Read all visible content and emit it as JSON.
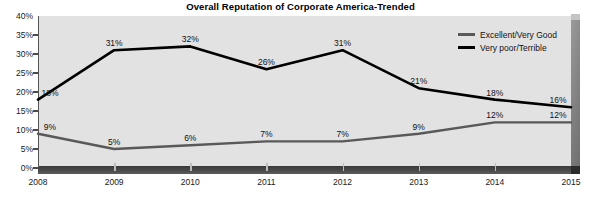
{
  "chart_data": {
    "type": "line",
    "title": "Overall Reputation of Corporate America-Trended",
    "xlabel": "",
    "ylabel": "",
    "categories": [
      "2008",
      "2009",
      "2010",
      "2011",
      "2012",
      "2013",
      "2014",
      "2015"
    ],
    "ylim": [
      0,
      40
    ],
    "yticks": [
      "0%",
      "5%",
      "10%",
      "15%",
      "20%",
      "25%",
      "30%",
      "35%",
      "40%"
    ],
    "ytick_values": [
      0,
      5,
      10,
      15,
      20,
      25,
      30,
      35,
      40
    ],
    "grid": false,
    "legend_position": "top-right",
    "series": [
      {
        "name": "Excellent/Very Good",
        "color": "#595959",
        "values": [
          9,
          5,
          6,
          7,
          7,
          9,
          12,
          12
        ],
        "labels": [
          "9%",
          "5%",
          "6%",
          "7%",
          "7%",
          "9%",
          "12%",
          "12%"
        ]
      },
      {
        "name": "Very poor/Terrible",
        "color": "#000000",
        "values": [
          18,
          31,
          32,
          26,
          31,
          21,
          18,
          16
        ],
        "labels": [
          "18%",
          "31%",
          "32%",
          "26%",
          "31%",
          "21%",
          "18%",
          "16%"
        ]
      }
    ]
  },
  "colors": {
    "plot_background": "#e2e2e2",
    "page_background": "#ffffff",
    "excellent_line": "#595959",
    "very_poor_line": "#000000",
    "floor": "#3a3a3a",
    "depth_panel": "#7e7e7e"
  }
}
